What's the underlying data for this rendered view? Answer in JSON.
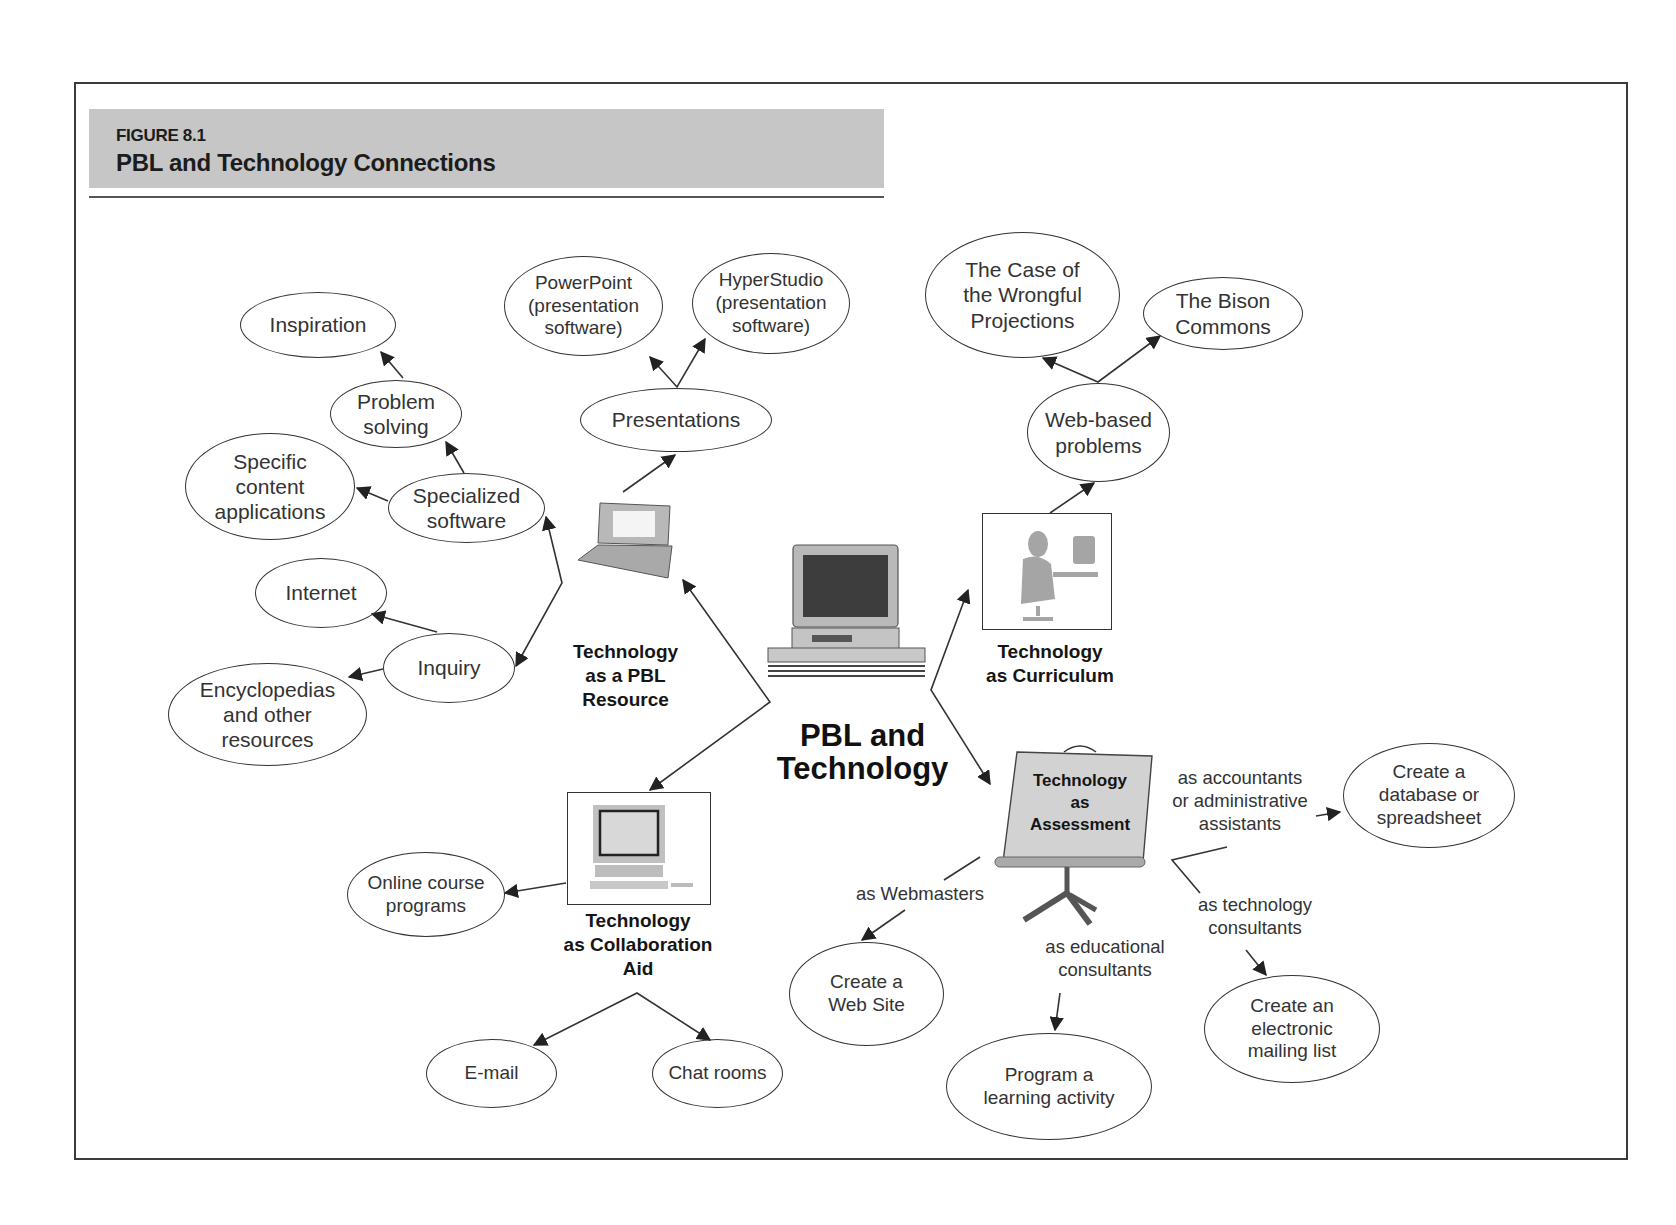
{
  "figure": {
    "number": "FIGURE 8.1",
    "title": "PBL and Technology Connections"
  },
  "center": {
    "title": "PBL and\nTechnology",
    "icon": "desktop-computer-icon"
  },
  "hubs": {
    "resource": {
      "label": "Technology\nas a PBL\nResource",
      "icon": "laptop-icon"
    },
    "curriculum": {
      "label": "Technology\nas Curriculum",
      "icon": "person-at-computer-icon"
    },
    "collaboration": {
      "label": "Technology\nas Collaboration\nAid",
      "icon": "desktop-computer-icon"
    },
    "assessment": {
      "label": "Technology\nas\nAssessment",
      "icon": "easel-icon"
    }
  },
  "nodes": {
    "presentations": "Presentations",
    "powerpoint": "PowerPoint\n(presentation\nsoftware)",
    "hyperstudio": "HyperStudio\n(presentation\nsoftware)",
    "specialized_software": "Specialized\nsoftware",
    "problem_solving": "Problem\nsolving",
    "inspiration": "Inspiration",
    "specific_content": "Specific\ncontent\napplications",
    "inquiry": "Inquiry",
    "internet": "Internet",
    "encyclopedias": "Encyclopedias\nand other\nresources",
    "web_based_problems": "Web-based\nproblems",
    "case_wrongful": "The Case of\nthe Wrongful\nProjections",
    "bison_commons": "The Bison\nCommons",
    "online_course": "Online course\nprograms",
    "email": "E-mail",
    "chat_rooms": "Chat rooms",
    "create_database": "Create a\ndatabase or\nspreadsheet",
    "create_website": "Create a\nWeb Site",
    "program_activity": "Program a\nlearning activity",
    "create_mailing_list": "Create an\nelectronic\nmailing list"
  },
  "edge_labels": {
    "accountants": "as accountants\nor administrative\nassistants",
    "webmasters": "as Webmasters",
    "educational": "as educational\nconsultants",
    "tech_consultants": "as technology\nconsultants"
  },
  "colors": {
    "header_band": "#c6c6c6",
    "line": "#333333",
    "illustration_gray": "#a8a8a8"
  }
}
